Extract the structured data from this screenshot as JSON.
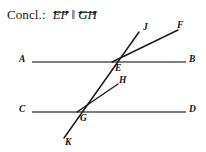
{
  "conclusion": {
    "label": "Concl.:",
    "first_line": "EF",
    "parallel_symbol": "‖",
    "second_line": "GH"
  },
  "diagram": {
    "labels": {
      "A": "A",
      "B": "B",
      "C": "C",
      "D": "D",
      "E": "E",
      "F": "F",
      "G": "G",
      "H": "H",
      "J": "J",
      "K": "K"
    },
    "colors": {
      "line": "#555555",
      "ray": "#1a1a1a",
      "text": "#111111",
      "background": "#ffffff"
    },
    "geometry": {
      "line_AB": {
        "x1": 32,
        "y1": 62,
        "x2": 186,
        "y2": 62
      },
      "line_CD": {
        "x1": 32,
        "y1": 112,
        "x2": 186,
        "y2": 112
      },
      "transversal_JK": {
        "x1": 139,
        "y1": 32,
        "x2": 64,
        "y2": 138
      },
      "ray_EF": {
        "x1": 112,
        "y1": 62,
        "x2": 178,
        "y2": 30
      },
      "ray_GH": {
        "x1": 77,
        "y1": 112,
        "x2": 118,
        "y2": 84
      },
      "point_E": {
        "x": 112,
        "y": 62
      },
      "point_G": {
        "x": 77,
        "y": 112
      }
    }
  }
}
